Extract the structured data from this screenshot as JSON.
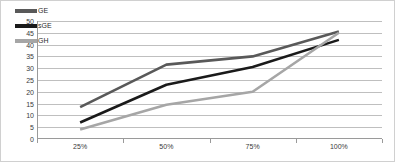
{
  "chart_data": {
    "type": "line",
    "title": "",
    "xlabel": "",
    "ylabel": "",
    "categories": [
      "25%",
      "50%",
      "75%",
      "100%"
    ],
    "ylim": [
      0,
      50
    ],
    "ytick_step": 5,
    "yticks": [
      "50",
      "45",
      "40",
      "35",
      "30",
      "25",
      "20",
      "15",
      "10",
      "5",
      "0"
    ],
    "grid": true,
    "legend_position": "top-left",
    "series": [
      {
        "name": "GE",
        "color": "#595959",
        "values": [
          13.5,
          31.5,
          35.0,
          45.5
        ]
      },
      {
        "name": "sGE",
        "color": "#1a1a1a",
        "values": [
          7.0,
          23.0,
          30.5,
          42.0
        ]
      },
      {
        "name": "GH",
        "color": "#a6a6a6",
        "values": [
          4.0,
          14.5,
          20.0,
          45.0
        ]
      }
    ]
  },
  "colors": {
    "gridline": "#bfbfbf",
    "axis": "#9a9a9a",
    "border": "#d0d0d0",
    "background": "#ffffff",
    "tick_text": "#3a3a3a"
  }
}
